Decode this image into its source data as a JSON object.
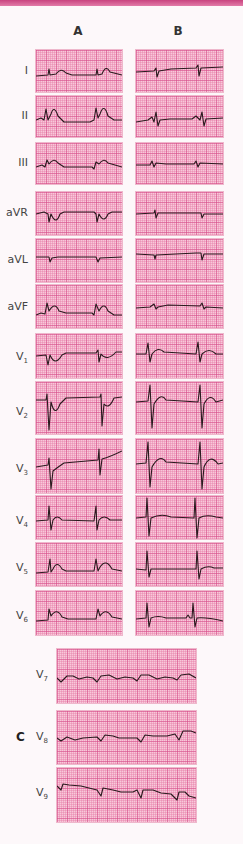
{
  "columns": {
    "a": "A",
    "b": "B"
  },
  "panel_c_label": "C",
  "leads": [
    {
      "name": "I",
      "sub": ""
    },
    {
      "name": "II",
      "sub": ""
    },
    {
      "name": "III",
      "sub": ""
    },
    {
      "name": "aVR",
      "sub": ""
    },
    {
      "name": "aVL",
      "sub": ""
    },
    {
      "name": "aVF",
      "sub": ""
    },
    {
      "name": "V",
      "sub": "1"
    },
    {
      "name": "V",
      "sub": "2"
    },
    {
      "name": "V",
      "sub": "3"
    },
    {
      "name": "V",
      "sub": "4"
    },
    {
      "name": "V",
      "sub": "5"
    },
    {
      "name": "V",
      "sub": "6"
    }
  ],
  "posterior_leads": [
    {
      "name": "V",
      "sub": "7"
    },
    {
      "name": "V",
      "sub": "8"
    },
    {
      "name": "V",
      "sub": "9"
    }
  ],
  "colors": {
    "grid_bg": "#f7c9da",
    "grid_major": "#d6508c",
    "trace": "#2a1a1e",
    "top_band": "#c9447f"
  }
}
